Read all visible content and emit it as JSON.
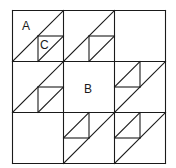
{
  "diagram": {
    "title": "",
    "grid": {
      "rows": 3,
      "cols": 3,
      "x0": 12.5,
      "y0": 10.5,
      "cell_w": 51,
      "cell_h": 51
    },
    "stroke_color": "#1a1a1a",
    "background": "#ffffff",
    "labels": [
      {
        "id": "A",
        "text": "A",
        "x": 22,
        "y": 30
      },
      {
        "id": "B",
        "text": "B",
        "x": 84,
        "y": 93
      },
      {
        "id": "C",
        "text": "C",
        "x": 40,
        "y": 49
      }
    ],
    "cells": [
      {
        "row": 0,
        "col": 0,
        "big_diagonal": true,
        "small_square": "bottom-right"
      },
      {
        "row": 0,
        "col": 1,
        "big_diagonal": true,
        "small_square": "bottom-right"
      },
      {
        "row": 0,
        "col": 2,
        "big_diagonal": false,
        "small_square": "none"
      },
      {
        "row": 1,
        "col": 0,
        "big_diagonal": true,
        "small_square": "bottom-right"
      },
      {
        "row": 1,
        "col": 1,
        "big_diagonal": false,
        "small_square": "none"
      },
      {
        "row": 1,
        "col": 2,
        "big_diagonal": true,
        "small_square": "top-left"
      },
      {
        "row": 2,
        "col": 0,
        "big_diagonal": false,
        "small_square": "none"
      },
      {
        "row": 2,
        "col": 1,
        "big_diagonal": true,
        "small_square": "top-left"
      },
      {
        "row": 2,
        "col": 2,
        "big_diagonal": true,
        "small_square": "top-left"
      }
    ]
  }
}
